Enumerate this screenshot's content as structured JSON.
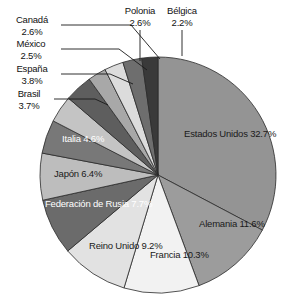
{
  "chart_data": {
    "type": "pie",
    "title": "",
    "subtitle": "",
    "xlabel": "",
    "ylabel": "",
    "legend_position": "none",
    "grid": false,
    "units": "%",
    "categories": [
      "Estados Unidos",
      "Alemania",
      "Francia",
      "Reino Unido",
      "Federación de Rusia",
      "Japón",
      "Italia",
      "Brasil",
      "España",
      "México",
      "Canadá",
      "Polonia",
      "Bélgica"
    ],
    "values": [
      32.7,
      11.6,
      10.3,
      9.2,
      7.7,
      6.4,
      4.6,
      3.7,
      3.8,
      2.5,
      2.6,
      2.6,
      2.2
    ],
    "slices": [
      {
        "name": "Estados Unidos",
        "value": 32.7,
        "label": "32.7%",
        "color": "#949494",
        "label_placement": "inside",
        "text_color": "dark"
      },
      {
        "name": "Alemania",
        "value": 11.6,
        "label": "11.6%",
        "color": "#9c9c9c",
        "label_placement": "inside",
        "text_color": "dark"
      },
      {
        "name": "Francia",
        "value": 10.3,
        "label": "10.3%",
        "color": "#f2f2f2",
        "label_placement": "inside",
        "text_color": "light"
      },
      {
        "name": "Reino Unido",
        "value": 9.2,
        "label": "9.2%",
        "color": "#e2e2e2",
        "label_placement": "inside",
        "text_color": "light"
      },
      {
        "name": "Federación de Rusia",
        "value": 7.7,
        "label": "7.7%",
        "color": "#6b6b6b",
        "label_placement": "inside",
        "text_color": "white"
      },
      {
        "name": "Japón",
        "value": 6.4,
        "label": "6.4%",
        "color": "#bdbdbd",
        "label_placement": "inside",
        "text_color": "light"
      },
      {
        "name": "Italia",
        "value": 4.6,
        "label": "4.6%",
        "color": "#787878",
        "label_placement": "inside",
        "text_color": "white"
      },
      {
        "name": "Brasil",
        "value": 3.7,
        "label": "3.7%",
        "color": "#c4c4c4",
        "label_placement": "callout",
        "text_color": "light"
      },
      {
        "name": "España",
        "value": 3.8,
        "label": "3.8%",
        "color": "#5e5e5e",
        "label_placement": "callout",
        "text_color": "light"
      },
      {
        "name": "México",
        "value": 2.5,
        "label": "2.5%",
        "color": "#a8a8a8",
        "label_placement": "callout",
        "text_color": "light"
      },
      {
        "name": "Canadá",
        "value": 2.6,
        "label": "2.6%",
        "color": "#dcdcdc",
        "label_placement": "callout",
        "text_color": "light"
      },
      {
        "name": "Polonia",
        "value": 2.6,
        "label": "2.6%",
        "color": "#6e6e6e",
        "label_placement": "callout",
        "text_color": "light"
      },
      {
        "name": "Bélgica",
        "value": 2.2,
        "label": "2.2%",
        "color": "#3a3a3a",
        "label_placement": "callout",
        "text_color": "light"
      }
    ]
  },
  "labels": {
    "estados_unidos": {
      "name": "Estados Unidos",
      "pct": "32.7%"
    },
    "alemania": {
      "name": "Alemania",
      "pct": "11.6%"
    },
    "francia": {
      "name": "Francia",
      "pct": "10.3%"
    },
    "reino_unido": {
      "name": "Reino Unido",
      "pct": "9.2%"
    },
    "rusia": {
      "name": "Federación",
      "name2": "de Rusia",
      "pct": "7.7%"
    },
    "japon": {
      "name": "Japón",
      "pct": "6.4%"
    },
    "italia": {
      "name": "Italia",
      "pct": "4.6%"
    },
    "brasil": {
      "name": "Brasil",
      "pct": "3.7%"
    },
    "espana": {
      "name": "España",
      "pct": "3.8%"
    },
    "mexico": {
      "name": "México",
      "pct": "2.5%"
    },
    "canada": {
      "name": "Canadá",
      "pct": "2.6%"
    },
    "polonia": {
      "name": "Polonia",
      "pct": "2.6%"
    },
    "belgica": {
      "name": "Bélgica",
      "pct": "2.2%"
    }
  }
}
